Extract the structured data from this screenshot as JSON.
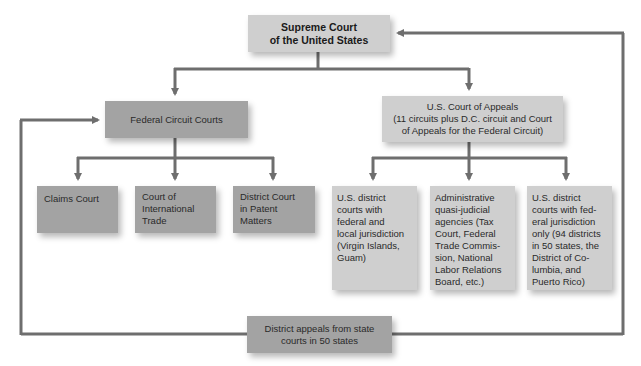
{
  "colors": {
    "line": "#6e6e6e",
    "dark_box": "#a3a3a3",
    "light_box": "#cfcfcf",
    "background": "#ffffff"
  },
  "supreme_court": {
    "lines": [
      "Supreme Court",
      "of the United States"
    ]
  },
  "federal_circuit": {
    "label": "Federal Circuit Courts",
    "children": [
      {
        "lines": [
          "Claims Court"
        ]
      },
      {
        "lines": [
          "Court of",
          "International",
          "Trade"
        ]
      },
      {
        "lines": [
          "District Court",
          "in Patent",
          "Matters"
        ]
      }
    ]
  },
  "court_of_appeals": {
    "lines": [
      "U.S. Court of Appeals",
      "(11 circuits plus D.C. circuit and Court",
      "of Appeals for the Federal Circuit)"
    ],
    "children": [
      {
        "lines": [
          "U.S. district",
          "courts with",
          "federal and",
          "local jurisdiction",
          "(Virgin Islands,",
          "Guam)"
        ]
      },
      {
        "lines": [
          "Administrative",
          "quasi-judicial",
          "agencies (Tax",
          "Court, Federal",
          "Trade Commis-",
          "sion, National",
          "Labor Relations",
          "Board, etc.)"
        ]
      },
      {
        "lines": [
          "U.S. district",
          "courts with fed-",
          "eral jurisdiction",
          "only (94 districts",
          "in 50 states, the",
          "District of Co-",
          "lumbia, and",
          "Puerto Rico)"
        ]
      }
    ]
  },
  "state_appeals": {
    "lines": [
      "District appeals from state",
      "courts in 50 states"
    ]
  }
}
